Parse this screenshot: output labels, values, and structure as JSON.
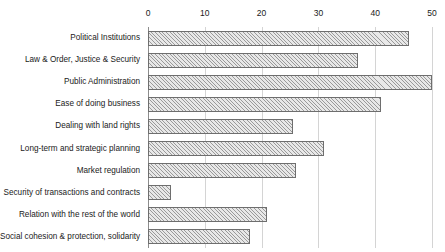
{
  "chart_data": {
    "type": "bar",
    "orientation": "horizontal",
    "title": "",
    "subtitle": "",
    "xlabel": "",
    "ylabel": "",
    "xlim": [
      0,
      50
    ],
    "ylim": null,
    "grid": true,
    "legend": null,
    "legend_position": "none",
    "xticks": [
      0,
      10,
      20,
      30,
      40,
      50
    ],
    "xtick_labels": [
      "0",
      "10",
      "20",
      "30",
      "40",
      "50"
    ],
    "xaxis_position": "top",
    "categories": [
      "Political Institutions",
      "Law & Order, Justice & Security",
      "Public Administration",
      "Ease of doing business",
      "Dealing with land rights",
      "Long-term and strategic planning",
      "Market regulation",
      "Security of transactions and contracts",
      "Relation with the rest of the world",
      "Social cohesion & protection, solidarity"
    ],
    "values": [
      46,
      37,
      50,
      41,
      25.5,
      31,
      26,
      4,
      21,
      18
    ],
    "bar_fill_color": "#e8e8e8",
    "bar_edge_color": "#6e6e6e",
    "bar_hatch": "////",
    "grid_color": "#d4d4d4",
    "background_color": "#ffffff"
  }
}
